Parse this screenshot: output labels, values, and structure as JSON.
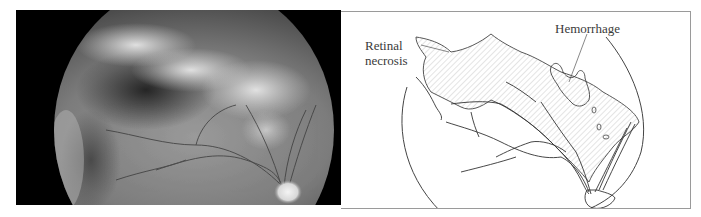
{
  "figure": {
    "left_panel": {
      "type": "fundus-photograph",
      "description": "Grayscale retinal fundus photograph with whitish areas of retinal necrosis and optic disc at lower right"
    },
    "right_panel": {
      "type": "schematic-drawing",
      "labels": {
        "necrosis_line1": "Retinal",
        "necrosis_line2": "necrosis",
        "hemorrhage": "Hemorrhage"
      }
    },
    "colors": {
      "photo_background": "#000000",
      "border": "#9a9a9a",
      "line": "#333333",
      "hatch": "#b8b8b8"
    }
  }
}
